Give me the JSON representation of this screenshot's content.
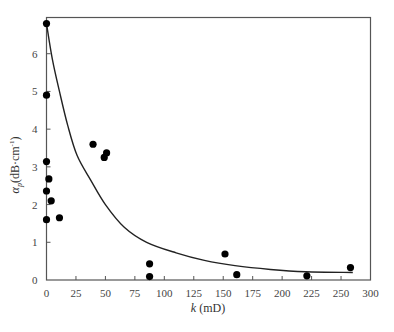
{
  "chart_data": {
    "type": "scatter",
    "title": "",
    "xlabel": "k (mD)",
    "ylabel": "αp(dB·cm⁻¹)",
    "xlabel_parts": {
      "var": "k",
      "unit": " (mD)"
    },
    "ylabel_parts": {
      "var": "α",
      "sub": "p",
      "unit": "(dB·cm",
      "sup": "-1",
      "close": ")"
    },
    "xlim": [
      0,
      275
    ],
    "ylim": [
      0,
      7
    ],
    "x_ticks": [
      0,
      25,
      50,
      75,
      100,
      125,
      150,
      175,
      200,
      225,
      250,
      275
    ],
    "x_tick_labels": [
      "0",
      "25",
      "50",
      "75",
      "100",
      "125",
      "150",
      "175",
      "200",
      "225",
      "250",
      "300"
    ],
    "y_ticks": [
      0,
      1,
      2,
      3,
      4,
      5,
      6
    ],
    "y_tick_labels": [
      "0",
      "1",
      "2",
      "3",
      "4",
      "5",
      "6"
    ],
    "grid": false,
    "legend": null,
    "series": [
      {
        "name": "measured",
        "type": "scatter",
        "points": [
          {
            "x": 0,
            "y": 6.8
          },
          {
            "x": 0,
            "y": 4.9
          },
          {
            "x": 0,
            "y": 3.14
          },
          {
            "x": 2,
            "y": 2.68
          },
          {
            "x": 0,
            "y": 2.36
          },
          {
            "x": 4,
            "y": 2.1
          },
          {
            "x": 0,
            "y": 1.6
          },
          {
            "x": 11,
            "y": 1.65
          },
          {
            "x": 39.5,
            "y": 3.6
          },
          {
            "x": 49,
            "y": 3.25
          },
          {
            "x": 51,
            "y": 3.37
          },
          {
            "x": 87.5,
            "y": 0.43
          },
          {
            "x": 87.5,
            "y": 0.09
          },
          {
            "x": 151.5,
            "y": 0.69
          },
          {
            "x": 161.5,
            "y": 0.14
          },
          {
            "x": 221,
            "y": 0.11
          },
          {
            "x": 258,
            "y": 0.33
          }
        ]
      },
      {
        "name": "fit",
        "type": "line",
        "points": [
          {
            "x": 0,
            "y": 6.8
          },
          {
            "x": 5,
            "y": 5.85
          },
          {
            "x": 11,
            "y": 5.0
          },
          {
            "x": 18,
            "y": 4.1
          },
          {
            "x": 26,
            "y": 3.3
          },
          {
            "x": 37.5,
            "y": 2.65
          },
          {
            "x": 50,
            "y": 2.0
          },
          {
            "x": 66,
            "y": 1.4
          },
          {
            "x": 85,
            "y": 1.0
          },
          {
            "x": 110,
            "y": 0.72
          },
          {
            "x": 134,
            "y": 0.52
          },
          {
            "x": 160,
            "y": 0.38
          },
          {
            "x": 190,
            "y": 0.28
          },
          {
            "x": 220,
            "y": 0.22
          },
          {
            "x": 260,
            "y": 0.2
          }
        ]
      }
    ]
  }
}
